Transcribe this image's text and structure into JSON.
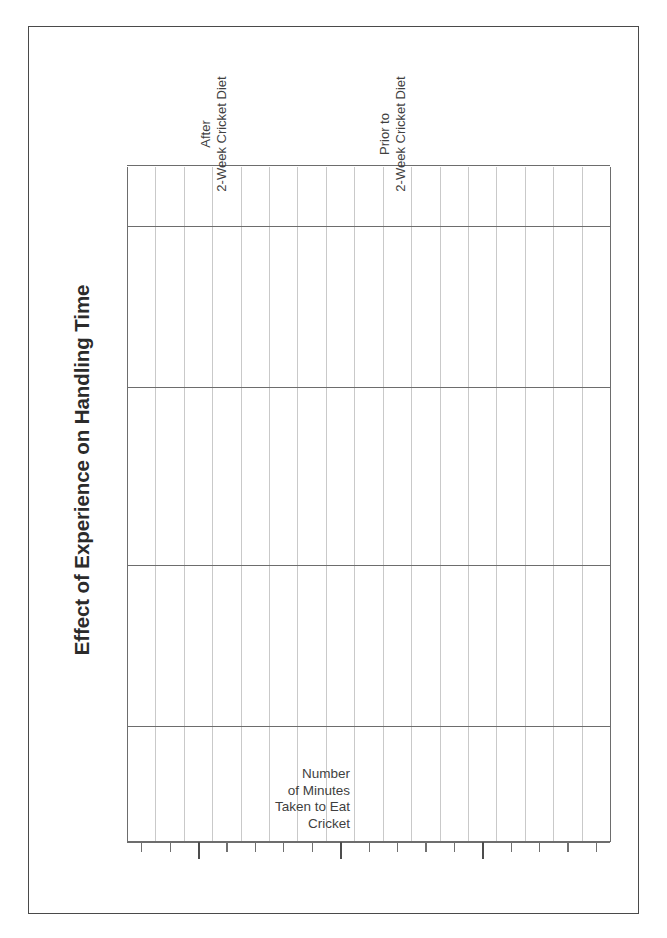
{
  "document": {
    "kind": "blank-graph-worksheet",
    "border_color": "#4a4a4a",
    "background": "#ffffff"
  },
  "chart_data": {
    "type": "bar",
    "title": "Effect of Experience on Handling Time",
    "subtitle": "",
    "orientation": "vertical",
    "rotated_degrees": -90,
    "blank": true,
    "categories": [
      "Prior to 2-Week Cricket Diet",
      "After 2-Week Cricket Diet"
    ],
    "category_lines": [
      [
        "Prior to",
        "2-Week Cricket Diet"
      ],
      [
        "After",
        "2-Week Cricket Diet"
      ]
    ],
    "values": [
      null,
      null
    ],
    "series": [
      {
        "name": "Number of Minutes Taken to Eat Cricket",
        "values": [
          null,
          null
        ]
      }
    ],
    "xlabel": "",
    "ylabel": "Number of Minutes Taken to Eat Cricket",
    "ylabel_lines": [
      "Number",
      "of Minutes",
      "Taken to Eat",
      "Cricket"
    ],
    "ylim": [
      null,
      null
    ],
    "tick_labels": [],
    "grid": {
      "enabled": true,
      "columns": 17,
      "column_gridlines": 18,
      "major_column_indices": [
        0,
        4,
        9,
        13,
        17
      ],
      "row_major_lines": 4,
      "minor_color": "#c9c9c9",
      "major_color": "#6d6d6d"
    },
    "legend": {
      "visible": false,
      "position": "none"
    },
    "axis_ticks": {
      "count": 17,
      "major_indices": [
        2,
        7,
        12
      ],
      "minor_color": "#707070",
      "major_color": "#4d4d4d"
    }
  },
  "chart": {
    "title": "Effect of Experience on Handling Time",
    "value_axis_label_lines": [
      "Number",
      "of Minutes",
      "Taken to Eat",
      "Cricket"
    ],
    "category_labels": [
      {
        "line1": "Prior to",
        "line2": "2-Week Cricket Diet"
      },
      {
        "line1": "After",
        "line2": "2-Week Cricket Diet"
      }
    ]
  },
  "colors": {
    "text": "#3f3f3f",
    "title": "#2b2b2b",
    "grid_minor": "#c9c9c9",
    "grid_major": "#6d6d6d",
    "axis": "#4d4d4d",
    "frame": "#4a4a4a"
  }
}
